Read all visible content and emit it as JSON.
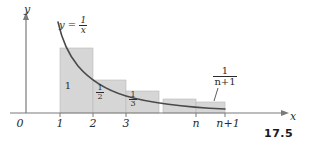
{
  "figure": {
    "number": "17.5",
    "axes": {
      "y_label": "y",
      "x_label": "x"
    },
    "curve": {
      "equation_lhs": "y =",
      "equation_numerator": "1",
      "equation_denominator": "x",
      "color": "#4a4a4a"
    },
    "x_ticks": [
      {
        "label": "0"
      },
      {
        "label": "1"
      },
      {
        "label": "2"
      },
      {
        "label": "3"
      },
      {
        "label": "n"
      },
      {
        "label": "n+1"
      }
    ],
    "rectangles": [
      {
        "label": "1",
        "numerator": "",
        "denominator": ""
      },
      {
        "label": "",
        "numerator": "1",
        "denominator": "2"
      },
      {
        "label": "",
        "numerator": "1",
        "denominator": "3"
      },
      {
        "label": "",
        "numerator": "1",
        "denominator": "n+1"
      }
    ],
    "colors": {
      "fill": "#d6d6d6",
      "stroke": "#4a4a4a",
      "axis": "#6b6b6b",
      "text": "#2b2b2b"
    }
  }
}
